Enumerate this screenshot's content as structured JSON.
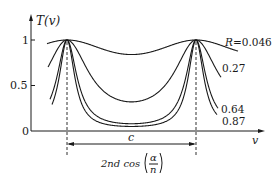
{
  "chart_data": {
    "type": "line",
    "title": "",
    "xlabel": "v",
    "ylabel": "T(v)",
    "ylim": [
      0,
      1
    ],
    "yticks": [
      {
        "value": 0,
        "label": "0"
      },
      {
        "value": 0.5,
        "label": "0.5"
      },
      {
        "value": 1,
        "label": "1"
      }
    ],
    "grid": false,
    "legend": "inline labels at right",
    "peaks_x": [
      0,
      1
    ],
    "series": [
      {
        "name": "R=0.046",
        "label": "R=0.046",
        "R": 0.046,
        "min_T": 0.84,
        "peak_T": 1.0
      },
      {
        "name": "0.27",
        "label": "0.27",
        "R": 0.27,
        "min_T": 0.32,
        "peak_T": 1.0
      },
      {
        "name": "0.64",
        "label": "0.64",
        "R": 0.64,
        "min_T": 0.08,
        "peak_T": 1.0
      },
      {
        "name": "0.87",
        "label": "0.87",
        "R": 0.87,
        "min_T": 0.05,
        "peak_T": 1.0
      }
    ],
    "annotations": {
      "spacing_top": "c",
      "spacing_bottom_prefix": "2nd cos",
      "spacing_bottom_frac_num": "α",
      "spacing_bottom_frac_den": "n"
    }
  },
  "labels": {
    "y_axis": "T(v)",
    "x_axis": "v",
    "tick_1": "1",
    "tick_05": "0.5",
    "tick_0": "0",
    "r0": "R=0.046",
    "r1": "0.27",
    "r2": "0.64",
    "r3": "0.87",
    "c": "c",
    "fsr_prefix": "2nd cos",
    "fsr_num": "α",
    "fsr_den": "n"
  }
}
